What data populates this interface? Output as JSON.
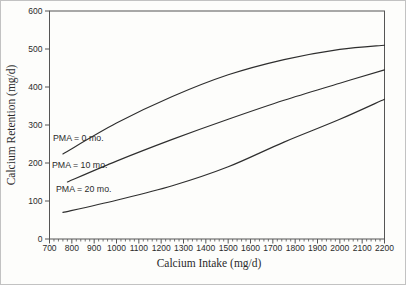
{
  "figure": {
    "background": "#fdfdfb",
    "frame_color": "#555555",
    "border_color": "#c2c2c2"
  },
  "chart_data": {
    "type": "line",
    "title": "",
    "xlabel": "Calcium Intake (mg/d)",
    "ylabel": "Calcium Retention (mg/d)",
    "xlim": [
      700,
      2200
    ],
    "ylim": [
      0,
      600
    ],
    "grid": false,
    "legend_position": "inline-curve-labels",
    "x_tick_step": 100,
    "x_minor_tick_step": 20,
    "y_tick_step": 100,
    "x_ticks": [
      700,
      800,
      900,
      1000,
      1100,
      1200,
      1300,
      1400,
      1500,
      1600,
      1700,
      1800,
      1900,
      2000,
      2100,
      2200
    ],
    "y_ticks": [
      0,
      100,
      200,
      300,
      400,
      500,
      600
    ],
    "line_color": "#2e2e2e",
    "series": [
      {
        "name": "PMA = 0 mo.",
        "label": "PMA = 0 mo.",
        "label_px": [
          52,
          140
        ],
        "points": [
          [
            760,
            224
          ],
          [
            1000,
            305
          ],
          [
            1250,
            375
          ],
          [
            1500,
            432
          ],
          [
            1750,
            472
          ],
          [
            2000,
            499
          ],
          [
            2200,
            510
          ]
        ]
      },
      {
        "name": "PMA = 10 mo.",
        "label": "PMA = 10 mo.",
        "label_px": [
          51,
          167
        ],
        "points": [
          [
            780,
            150
          ],
          [
            1000,
            205
          ],
          [
            1250,
            262
          ],
          [
            1500,
            315
          ],
          [
            1750,
            365
          ],
          [
            2000,
            410
          ],
          [
            2200,
            445
          ]
        ]
      },
      {
        "name": "PMA = 20 mo.",
        "label": "PMA = 20 mo.",
        "label_px": [
          55,
          191
        ],
        "points": [
          [
            760,
            70
          ],
          [
            1000,
            102
          ],
          [
            1250,
            140
          ],
          [
            1500,
            190
          ],
          [
            1750,
            255
          ],
          [
            2000,
            315
          ],
          [
            2200,
            368
          ]
        ]
      }
    ]
  }
}
